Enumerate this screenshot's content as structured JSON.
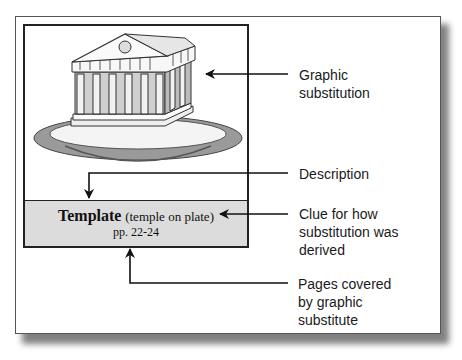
{
  "figure": {
    "graphic_alt": "temple on plate illustration",
    "caption": {
      "title": "Template",
      "paren": "(temple on plate)",
      "pages": "pp. 22-24"
    }
  },
  "callouts": [
    {
      "id": "graphic",
      "lines": [
        "Graphic",
        "substitution"
      ]
    },
    {
      "id": "description",
      "lines": [
        "Description"
      ]
    },
    {
      "id": "clue",
      "lines": [
        "Clue for how",
        "substitution was",
        "derived"
      ]
    },
    {
      "id": "pages",
      "lines": [
        "Pages covered",
        "by graphic",
        "substitute"
      ]
    }
  ],
  "colors": {
    "caption_bg": "#dcdcdc",
    "line": "#111111",
    "plate": "#9a9a9a"
  }
}
